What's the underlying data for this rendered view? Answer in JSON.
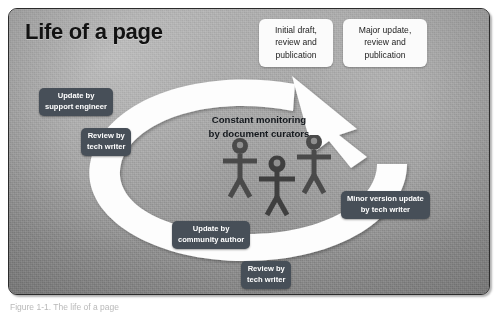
{
  "figure": {
    "title": "Life of a page",
    "caption": "Figure 1-1. The life of a page",
    "center_heading": {
      "lines": [
        "Constant monitoring",
        "by document curators"
      ]
    },
    "white_callouts": [
      {
        "id": "initial-draft",
        "name": "callout-initial-draft",
        "lines": [
          "Initial draft,",
          "review and",
          "publication"
        ]
      },
      {
        "id": "major-update",
        "name": "callout-major-update",
        "lines": [
          "Major update,",
          "review and",
          "publication"
        ]
      }
    ],
    "dark_labels": [
      {
        "id": "support-engineer",
        "name": "label-update-by-support-engineer",
        "lines": [
          "Update by",
          "support engineer"
        ]
      },
      {
        "id": "review-tech-1",
        "name": "label-review-by-tech-writer-top",
        "lines": [
          "Review by",
          "tech writer"
        ]
      },
      {
        "id": "minor-version",
        "name": "label-minor-version-update-by-tech-writer",
        "lines": [
          "Minor version update",
          "by tech writer"
        ]
      },
      {
        "id": "community-author",
        "name": "label-update-by-community-author",
        "lines": [
          "Update by",
          "community author"
        ]
      },
      {
        "id": "review-tech-2",
        "name": "label-review-by-tech-writer-bottom",
        "lines": [
          "Review by",
          "tech writer"
        ]
      }
    ],
    "stick_figures": {
      "count": 3,
      "semantic": "document-curator-figures"
    },
    "colors": {
      "background": "#9a9a9a",
      "frame_border": "#2b2b2b",
      "arrow": "#fdfdfd",
      "dark_label_bg": "#474f58",
      "dark_label_text": "#ffffff",
      "white_callout_bg": "#fbfbfb",
      "title_text": "#121212",
      "figure_fill": "#4a4a4a"
    }
  }
}
